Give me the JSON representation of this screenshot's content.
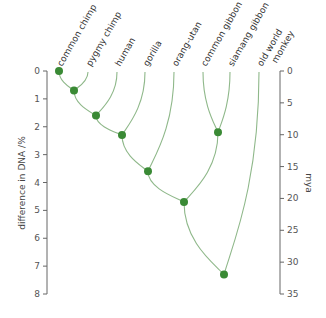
{
  "chart_data": {
    "type": "dendrogram",
    "title": "",
    "left_axis": {
      "label": "difference in DNA /%",
      "ticks": [
        0,
        1,
        2,
        3,
        4,
        5,
        6,
        7,
        8
      ],
      "range": [
        0,
        8
      ]
    },
    "right_axis": {
      "label": "mya",
      "ticks": [
        0,
        5,
        10,
        15,
        20,
        25,
        30,
        35
      ],
      "range": [
        0,
        35
      ]
    },
    "leaves": [
      {
        "id": "common_chimp",
        "label": "common chimp"
      },
      {
        "id": "pygmy_chimp",
        "label": "pygmy chimp"
      },
      {
        "id": "human",
        "label": "human"
      },
      {
        "id": "gorilla",
        "label": "gorilla"
      },
      {
        "id": "orang_utan",
        "label": "orang-utan"
      },
      {
        "id": "common_gibbon",
        "label": "common gibbon"
      },
      {
        "id": "siamang_gibbon",
        "label": "siamang gibbon"
      },
      {
        "id": "old_world_monkey",
        "label": "old world monkey"
      }
    ],
    "nodes": [
      {
        "id": "n_chimp",
        "dna_diff": 0.0,
        "joins": [
          "common_chimp"
        ]
      },
      {
        "id": "n_pan",
        "dna_diff": 0.7,
        "joins": [
          "n_chimp",
          "pygmy_chimp"
        ]
      },
      {
        "id": "n_human",
        "dna_diff": 1.6,
        "joins": [
          "n_pan",
          "human"
        ]
      },
      {
        "id": "n_gorilla",
        "dna_diff": 2.3,
        "joins": [
          "n_human",
          "gorilla"
        ]
      },
      {
        "id": "n_orang",
        "dna_diff": 3.6,
        "joins": [
          "n_gorilla",
          "orang_utan"
        ]
      },
      {
        "id": "n_gibbons",
        "dna_diff": 2.2,
        "joins": [
          "common_gibbon",
          "siamang_gibbon"
        ]
      },
      {
        "id": "n_hominoids",
        "dna_diff": 4.7,
        "joins": [
          "n_orang",
          "n_gibbons"
        ]
      },
      {
        "id": "n_root",
        "dna_diff": 7.3,
        "joins": [
          "n_hominoids",
          "old_world_monkey"
        ]
      }
    ],
    "colors": {
      "node": "#3a8a35",
      "branch": "#8fb88a",
      "axis": "#666666"
    }
  }
}
